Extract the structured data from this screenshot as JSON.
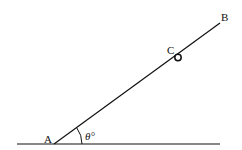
{
  "diagram": {
    "type": "geometry",
    "stroke_color": "#111111",
    "points": {
      "A": {
        "label": "A",
        "x": 54,
        "y": 144
      },
      "B": {
        "label": "B",
        "x": 220,
        "y": 23
      },
      "C": {
        "label": "C",
        "x": 178,
        "y": 57
      }
    },
    "ground": {
      "x1": 17,
      "x2": 220,
      "y": 144
    },
    "angle": {
      "label": "θ°",
      "vertex": "A"
    },
    "labels": {
      "A": "A",
      "B": "B",
      "C": "C",
      "theta": "θ°"
    }
  }
}
